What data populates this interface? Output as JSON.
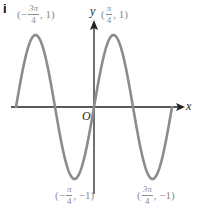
{
  "part_label": "i",
  "axes": {
    "x_label": "x",
    "y_label": "y",
    "origin_label": "O"
  },
  "annotations": [
    {
      "id": "max-left",
      "open": "(",
      "sign": "−",
      "num": "3π",
      "den": "4",
      "rest": ", 1)"
    },
    {
      "id": "max-right",
      "open": "(",
      "sign": "",
      "num": "π",
      "den": "4",
      "rest": ", 1)"
    },
    {
      "id": "min-left",
      "open": "(",
      "sign": "−",
      "num": "π",
      "den": "4",
      "rest": ", −1)"
    },
    {
      "id": "min-right",
      "open": "(",
      "sign": "",
      "num": "3π",
      "den": "4",
      "rest": ", −1)"
    }
  ],
  "colors": {
    "curve": "#8c8c8c",
    "axes": "#222222",
    "labels": "#8c8c8c"
  },
  "chart_data": {
    "type": "line",
    "title": "",
    "function": "y = sin(2x)",
    "xlabel": "x",
    "ylabel": "y",
    "xlim": [
      -3.14159,
      3.14159
    ],
    "ylim": [
      -1,
      1
    ],
    "grid": false,
    "legend": null,
    "key_points": [
      {
        "x": -3.14159,
        "y": 0,
        "label": ""
      },
      {
        "x": -2.35619,
        "y": 1,
        "label": "(-3π/4, 1)"
      },
      {
        "x": -1.5708,
        "y": 0,
        "label": ""
      },
      {
        "x": -0.7854,
        "y": -1,
        "label": "(-π/4, -1)"
      },
      {
        "x": 0,
        "y": 0,
        "label": "O"
      },
      {
        "x": 0.7854,
        "y": 1,
        "label": "(π/4, 1)"
      },
      {
        "x": 1.5708,
        "y": 0,
        "label": ""
      },
      {
        "x": 2.35619,
        "y": -1,
        "label": "(3π/4, -1)"
      },
      {
        "x": 3.14159,
        "y": 0,
        "label": ""
      }
    ]
  }
}
